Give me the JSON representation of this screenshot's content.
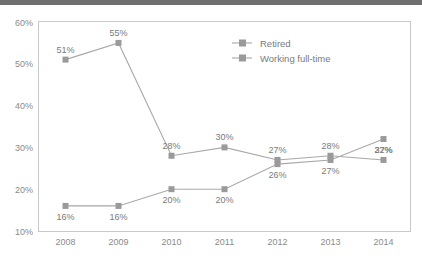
{
  "chart_data": {
    "type": "line",
    "title": "",
    "xlabel": "",
    "ylabel": "",
    "categories": [
      "2008",
      "2009",
      "2010",
      "2011",
      "2012",
      "2013",
      "2014"
    ],
    "ylim": [
      10,
      60
    ],
    "y_ticks": [
      "10%",
      "20%",
      "30%",
      "40%",
      "50%",
      "60%"
    ],
    "y_tick_values": [
      10,
      20,
      30,
      40,
      50,
      60
    ],
    "grid": false,
    "legend_position": "inside-top-center",
    "series": [
      {
        "name": "Retired",
        "values": [
          51,
          55,
          28,
          30,
          27,
          28,
          27
        ],
        "labels": [
          "51%",
          "55%",
          "28%",
          "30%",
          "27%",
          "28%",
          "27%"
        ],
        "color": "#9a9a9a",
        "marker": "square"
      },
      {
        "name": "Working full-time",
        "values": [
          16,
          16,
          20,
          20,
          26,
          27,
          32
        ],
        "labels": [
          "16%",
          "16%",
          "20%",
          "20%",
          "26%",
          "27%",
          "32%"
        ],
        "color": "#9a9a9a",
        "marker": "square"
      }
    ]
  },
  "legend": {
    "items": [
      {
        "label": "Retired"
      },
      {
        "label": "Working full-time"
      }
    ]
  }
}
